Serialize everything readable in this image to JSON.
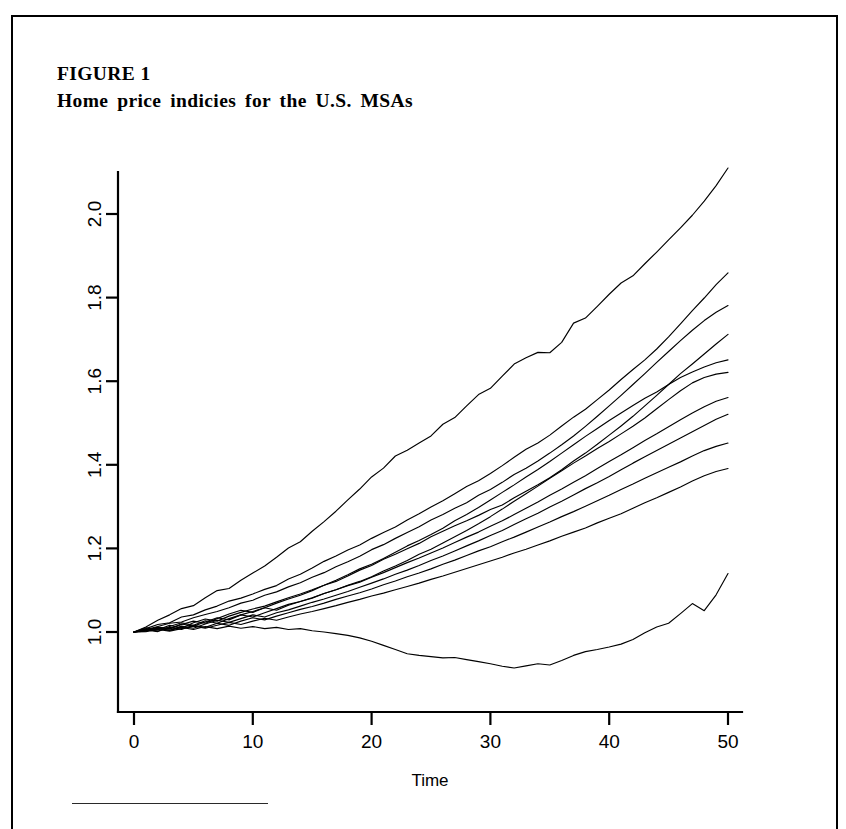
{
  "page": {
    "background": "#ffffff",
    "border_color": "#000000",
    "figure_label": "FIGURE 1",
    "figure_title": "Home price indicies for the U.S. MSAs"
  },
  "chart_data": {
    "type": "line",
    "title": "Home price indicies for the U.S. MSAs",
    "xlabel": "Time",
    "ylabel": "",
    "xlim": [
      0,
      52
    ],
    "ylim": [
      0.855,
      2.16
    ],
    "xticks": [
      0,
      10,
      20,
      30,
      40,
      50
    ],
    "xticklabels": [
      "0",
      "10",
      "20",
      "30",
      "40",
      "50"
    ],
    "yticks": [
      1.0,
      1.2,
      1.4,
      1.6,
      1.8,
      2.0
    ],
    "yticklabels": [
      "1.0",
      "1.2",
      "1.4",
      "1.6",
      "1.8",
      "2.0"
    ],
    "ytick_label_rotation": 90,
    "grid": false,
    "legend": "none",
    "line_color": "#000000",
    "x": [
      0,
      1,
      2,
      3,
      4,
      5,
      6,
      7,
      8,
      9,
      10,
      11,
      12,
      13,
      14,
      15,
      16,
      17,
      18,
      19,
      20,
      21,
      22,
      23,
      24,
      25,
      26,
      27,
      28,
      29,
      30,
      31,
      32,
      33,
      34,
      35,
      36,
      37,
      38,
      39,
      40,
      41,
      42,
      43,
      44,
      45,
      46,
      47,
      48,
      49,
      50
    ],
    "series": [
      {
        "name": "MSA 1",
        "final_value": 2.11,
        "values": [
          1.0,
          1.012,
          1.028,
          1.041,
          1.056,
          1.063,
          1.082,
          1.099,
          1.104,
          1.124,
          1.141,
          1.158,
          1.179,
          1.201,
          1.216,
          1.241,
          1.264,
          1.289,
          1.316,
          1.342,
          1.371,
          1.392,
          1.421,
          1.435,
          1.452,
          1.469,
          1.497,
          1.513,
          1.541,
          1.568,
          1.583,
          1.612,
          1.641,
          1.656,
          1.669,
          1.668,
          1.693,
          1.739,
          1.751,
          1.779,
          1.808,
          1.835,
          1.852,
          1.881,
          1.909,
          1.938,
          1.967,
          1.997,
          2.031,
          2.068,
          2.11
        ]
      },
      {
        "name": "MSA 2",
        "final_value": 1.86,
        "values": [
          1.0,
          1.008,
          1.018,
          1.022,
          1.036,
          1.041,
          1.053,
          1.062,
          1.074,
          1.081,
          1.091,
          1.102,
          1.111,
          1.127,
          1.138,
          1.153,
          1.169,
          1.182,
          1.196,
          1.208,
          1.224,
          1.238,
          1.251,
          1.268,
          1.283,
          1.299,
          1.314,
          1.331,
          1.348,
          1.362,
          1.379,
          1.398,
          1.418,
          1.437,
          1.452,
          1.471,
          1.493,
          1.514,
          1.533,
          1.556,
          1.579,
          1.604,
          1.628,
          1.651,
          1.677,
          1.706,
          1.737,
          1.769,
          1.799,
          1.831,
          1.859
        ]
      },
      {
        "name": "MSA 3",
        "final_value": 1.78,
        "values": [
          1.0,
          1.006,
          1.013,
          1.021,
          1.024,
          1.034,
          1.042,
          1.049,
          1.058,
          1.069,
          1.076,
          1.088,
          1.096,
          1.108,
          1.118,
          1.131,
          1.142,
          1.156,
          1.168,
          1.181,
          1.197,
          1.209,
          1.224,
          1.238,
          1.252,
          1.268,
          1.281,
          1.296,
          1.309,
          1.327,
          1.341,
          1.358,
          1.377,
          1.392,
          1.409,
          1.428,
          1.448,
          1.469,
          1.492,
          1.516,
          1.541,
          1.566,
          1.592,
          1.618,
          1.645,
          1.671,
          1.697,
          1.722,
          1.745,
          1.765,
          1.781
        ]
      },
      {
        "name": "MSA 4",
        "final_value": 1.71,
        "values": [
          1.0,
          1.004,
          1.011,
          1.007,
          1.018,
          1.026,
          1.021,
          1.032,
          1.043,
          1.052,
          1.047,
          1.058,
          1.069,
          1.079,
          1.088,
          1.099,
          1.112,
          1.121,
          1.134,
          1.148,
          1.159,
          1.174,
          1.186,
          1.199,
          1.212,
          1.228,
          1.241,
          1.254,
          1.266,
          1.279,
          1.293,
          1.304,
          1.321,
          1.337,
          1.352,
          1.369,
          1.388,
          1.409,
          1.428,
          1.449,
          1.471,
          1.493,
          1.516,
          1.541,
          1.566,
          1.592,
          1.618,
          1.641,
          1.665,
          1.689,
          1.712
        ]
      },
      {
        "name": "MSA 5",
        "final_value": 1.65,
        "values": [
          1.0,
          1.01,
          1.005,
          1.016,
          1.009,
          1.022,
          1.031,
          1.026,
          1.038,
          1.047,
          1.055,
          1.062,
          1.072,
          1.082,
          1.091,
          1.101,
          1.112,
          1.124,
          1.137,
          1.151,
          1.162,
          1.176,
          1.191,
          1.206,
          1.219,
          1.233,
          1.248,
          1.266,
          1.281,
          1.298,
          1.316,
          1.334,
          1.352,
          1.371,
          1.389,
          1.408,
          1.428,
          1.448,
          1.468,
          1.487,
          1.506,
          1.524,
          1.542,
          1.559,
          1.574,
          1.592,
          1.609,
          1.622,
          1.634,
          1.644,
          1.651
        ]
      },
      {
        "name": "MSA 6",
        "final_value": 1.62,
        "values": [
          1.0,
          1.003,
          1.012,
          1.008,
          1.019,
          1.014,
          1.024,
          1.034,
          1.029,
          1.041,
          1.049,
          1.058,
          1.052,
          1.064,
          1.073,
          1.081,
          1.092,
          1.101,
          1.112,
          1.121,
          1.132,
          1.146,
          1.158,
          1.171,
          1.186,
          1.198,
          1.213,
          1.228,
          1.243,
          1.259,
          1.276,
          1.294,
          1.313,
          1.331,
          1.349,
          1.368,
          1.386,
          1.404,
          1.421,
          1.439,
          1.456,
          1.474,
          1.492,
          1.512,
          1.534,
          1.556,
          1.577,
          1.596,
          1.609,
          1.617,
          1.621
        ]
      },
      {
        "name": "MSA 7",
        "final_value": 1.56,
        "values": [
          1.0,
          1.007,
          1.002,
          1.013,
          1.022,
          1.016,
          1.027,
          1.021,
          1.032,
          1.041,
          1.036,
          1.046,
          1.056,
          1.066,
          1.073,
          1.082,
          1.092,
          1.101,
          1.111,
          1.119,
          1.131,
          1.142,
          1.154,
          1.166,
          1.177,
          1.189,
          1.201,
          1.214,
          1.227,
          1.239,
          1.253,
          1.266,
          1.281,
          1.296,
          1.311,
          1.327,
          1.342,
          1.358,
          1.374,
          1.391,
          1.408,
          1.424,
          1.441,
          1.458,
          1.474,
          1.491,
          1.508,
          1.524,
          1.539,
          1.552,
          1.561
        ]
      },
      {
        "name": "MSA 8",
        "final_value": 1.52,
        "values": [
          1.0,
          1.002,
          1.009,
          1.004,
          1.014,
          1.009,
          1.019,
          1.028,
          1.023,
          1.032,
          1.041,
          1.036,
          1.046,
          1.053,
          1.062,
          1.071,
          1.079,
          1.088,
          1.097,
          1.107,
          1.117,
          1.127,
          1.138,
          1.148,
          1.159,
          1.171,
          1.182,
          1.194,
          1.206,
          1.218,
          1.231,
          1.243,
          1.257,
          1.271,
          1.284,
          1.299,
          1.313,
          1.328,
          1.343,
          1.357,
          1.372,
          1.388,
          1.404,
          1.419,
          1.434,
          1.449,
          1.464,
          1.479,
          1.494,
          1.509,
          1.521
        ]
      },
      {
        "name": "MSA 9",
        "final_value": 1.45,
        "values": [
          1.0,
          1.005,
          1.001,
          1.011,
          1.006,
          1.016,
          1.011,
          1.021,
          1.016,
          1.026,
          1.034,
          1.029,
          1.038,
          1.046,
          1.054,
          1.061,
          1.069,
          1.078,
          1.086,
          1.094,
          1.103,
          1.113,
          1.122,
          1.132,
          1.141,
          1.151,
          1.162,
          1.172,
          1.183,
          1.194,
          1.204,
          1.216,
          1.227,
          1.239,
          1.251,
          1.263,
          1.276,
          1.288,
          1.301,
          1.314,
          1.327,
          1.341,
          1.354,
          1.368,
          1.381,
          1.394,
          1.407,
          1.421,
          1.434,
          1.444,
          1.452
        ]
      },
      {
        "name": "MSA 10",
        "final_value": 1.39,
        "values": [
          1.0,
          1.001,
          1.006,
          1.002,
          1.008,
          1.014,
          1.009,
          1.016,
          1.023,
          1.018,
          1.026,
          1.033,
          1.028,
          1.036,
          1.043,
          1.049,
          1.056,
          1.063,
          1.071,
          1.078,
          1.086,
          1.093,
          1.101,
          1.109,
          1.117,
          1.126,
          1.134,
          1.143,
          1.152,
          1.161,
          1.17,
          1.179,
          1.189,
          1.198,
          1.208,
          1.218,
          1.229,
          1.239,
          1.249,
          1.261,
          1.272,
          1.283,
          1.296,
          1.309,
          1.321,
          1.334,
          1.347,
          1.361,
          1.374,
          1.384,
          1.391
        ]
      },
      {
        "name": "MSA 11",
        "final_value": 1.14,
        "values": [
          1.0,
          1.004,
          1.009,
          1.004,
          1.011,
          1.006,
          1.013,
          1.008,
          1.014,
          1.009,
          1.013,
          1.008,
          1.011,
          1.006,
          1.008,
          1.003,
          1.0,
          0.996,
          0.992,
          0.986,
          0.978,
          0.968,
          0.958,
          0.948,
          0.944,
          0.941,
          0.938,
          0.939,
          0.934,
          0.929,
          0.924,
          0.918,
          0.914,
          0.919,
          0.924,
          0.921,
          0.932,
          0.944,
          0.953,
          0.958,
          0.964,
          0.971,
          0.982,
          0.998,
          1.012,
          1.021,
          1.044,
          1.068,
          1.051,
          1.089,
          1.14
        ]
      }
    ]
  }
}
